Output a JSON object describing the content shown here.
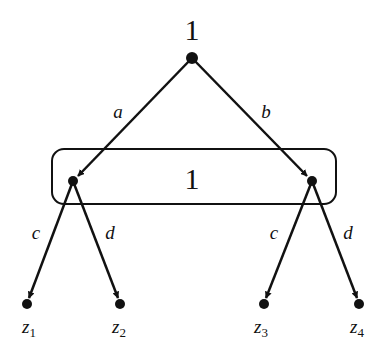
{
  "diagram": {
    "type": "extensive-form game tree",
    "root": {
      "player_label": "1"
    },
    "root_actions": [
      {
        "label": "a"
      },
      {
        "label": "b"
      }
    ],
    "information_set": {
      "player_label": "1"
    },
    "second_stage_actions": [
      {
        "label": "c"
      },
      {
        "label": "d"
      },
      {
        "label": "c"
      },
      {
        "label": "d"
      }
    ],
    "terminals": [
      {
        "base": "z",
        "sub": "1"
      },
      {
        "base": "z",
        "sub": "2"
      },
      {
        "base": "z",
        "sub": "3"
      },
      {
        "base": "z",
        "sub": "4"
      }
    ],
    "colors": {
      "stroke": "#111111",
      "background": "#ffffff"
    }
  }
}
